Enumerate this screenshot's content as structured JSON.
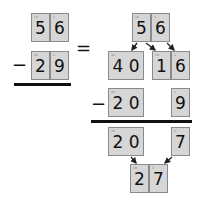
{
  "left": {
    "minuend": {
      "tens": "5",
      "ones": "6",
      "tens_label": "10",
      "ones_label": "1"
    },
    "operator": "−",
    "subtrahend": {
      "tens": "2",
      "ones": "9",
      "tens_label": "10",
      "ones_label": "1"
    }
  },
  "equals": "=",
  "right": {
    "top": {
      "tens": "5",
      "ones": "6",
      "tens_label": "10",
      "ones_label": "1"
    },
    "split": {
      "a": "4 0",
      "b": "1",
      "c": "6",
      "a_label": "10",
      "b_label": "10",
      "c_label": "1"
    },
    "operator": "−",
    "sub": {
      "a": "2 0",
      "b": "9",
      "a_label": "10",
      "b_label": "1"
    },
    "diff": {
      "a": "2 0",
      "b": "7",
      "a_label": "10",
      "b_label": "1"
    },
    "result": {
      "tens": "2",
      "ones": "7",
      "tens_label": "10",
      "ones_label": "1"
    }
  }
}
